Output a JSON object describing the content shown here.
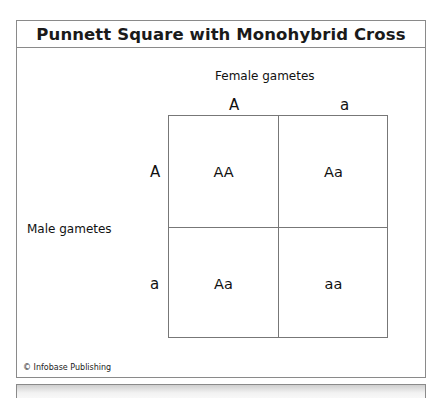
{
  "title": "Punnett Square with Monohybrid Cross",
  "female_label": "Female gametes",
  "male_label": "Male gametes",
  "female_gametes": [
    "A",
    "a"
  ],
  "male_gametes": [
    "A",
    "a"
  ],
  "cells": [
    [
      "AA",
      "Aa"
    ],
    [
      "Aa",
      "aa"
    ]
  ],
  "credit": "© Infobase Publishing"
}
